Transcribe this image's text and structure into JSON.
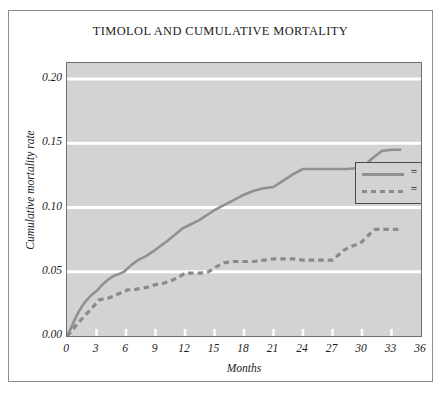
{
  "chart_data": {
    "type": "line",
    "title": "TIMOLOL AND CUMULATIVE MORTALITY",
    "xlabel": "Months",
    "ylabel": "Cumulative mortality rate",
    "xlim": [
      0,
      36
    ],
    "ylim": [
      0.0,
      0.2125
    ],
    "grid": "horizontal-white-gridlines",
    "plot_background": "#d3d3d3",
    "legend_position": "top-right-inside",
    "xticks": [
      "0",
      "3",
      "6",
      "9",
      "12",
      "15",
      "18",
      "21",
      "24",
      "27",
      "30",
      "33",
      "36"
    ],
    "xtick_values": [
      0,
      3,
      6,
      9,
      12,
      15,
      18,
      21,
      24,
      27,
      30,
      33,
      36
    ],
    "yticks": [
      "0.00",
      "0.05",
      "0.10",
      "0.15",
      "0.20"
    ],
    "ytick_values": [
      0.0,
      0.05,
      0.1,
      0.15,
      0.2
    ],
    "series": [
      {
        "name": "Placebo",
        "legend_label": "= Placebo",
        "style": "solid",
        "color": "#909090",
        "points": [
          [
            0.0,
            0.0
          ],
          [
            0.4,
            0.006
          ],
          [
            0.8,
            0.013
          ],
          [
            1.2,
            0.019
          ],
          [
            1.6,
            0.024
          ],
          [
            2.0,
            0.028
          ],
          [
            2.5,
            0.032
          ],
          [
            3.0,
            0.035
          ],
          [
            3.6,
            0.04
          ],
          [
            4.2,
            0.044
          ],
          [
            4.8,
            0.047
          ],
          [
            5.2,
            0.048
          ],
          [
            5.8,
            0.05
          ],
          [
            6.5,
            0.055
          ],
          [
            7.2,
            0.059
          ],
          [
            8.0,
            0.062
          ],
          [
            8.8,
            0.066
          ],
          [
            9.5,
            0.07
          ],
          [
            10.2,
            0.074
          ],
          [
            11.0,
            0.079
          ],
          [
            11.8,
            0.084
          ],
          [
            12.6,
            0.087
          ],
          [
            13.4,
            0.09
          ],
          [
            14.2,
            0.094
          ],
          [
            15.0,
            0.098
          ],
          [
            16.0,
            0.102
          ],
          [
            17.0,
            0.106
          ],
          [
            18.0,
            0.11
          ],
          [
            19.0,
            0.113
          ],
          [
            20.0,
            0.115
          ],
          [
            21.0,
            0.116
          ],
          [
            22.0,
            0.121
          ],
          [
            23.0,
            0.126
          ],
          [
            24.0,
            0.13
          ],
          [
            25.5,
            0.13
          ],
          [
            27.0,
            0.13
          ],
          [
            28.5,
            0.13
          ],
          [
            30.0,
            0.131
          ],
          [
            31.0,
            0.138
          ],
          [
            32.0,
            0.144
          ],
          [
            33.0,
            0.145
          ],
          [
            34.0,
            0.145
          ]
        ]
      },
      {
        "name": "Timolol",
        "legend_label": "= Timolol",
        "style": "dashed",
        "color": "#8a8a8a",
        "points": [
          [
            0.0,
            0.0
          ],
          [
            0.5,
            0.004
          ],
          [
            1.0,
            0.009
          ],
          [
            1.6,
            0.014
          ],
          [
            2.2,
            0.019
          ],
          [
            2.8,
            0.024
          ],
          [
            3.2,
            0.028
          ],
          [
            3.8,
            0.029
          ],
          [
            4.4,
            0.03
          ],
          [
            5.0,
            0.032
          ],
          [
            5.6,
            0.034
          ],
          [
            6.2,
            0.036
          ],
          [
            6.8,
            0.036
          ],
          [
            7.5,
            0.037
          ],
          [
            8.2,
            0.038
          ],
          [
            9.0,
            0.04
          ],
          [
            9.8,
            0.041
          ],
          [
            10.6,
            0.043
          ],
          [
            11.4,
            0.046
          ],
          [
            12.0,
            0.049
          ],
          [
            12.8,
            0.049
          ],
          [
            13.6,
            0.049
          ],
          [
            14.4,
            0.05
          ],
          [
            15.2,
            0.054
          ],
          [
            16.0,
            0.057
          ],
          [
            17.0,
            0.058
          ],
          [
            18.0,
            0.058
          ],
          [
            19.0,
            0.058
          ],
          [
            20.0,
            0.059
          ],
          [
            21.0,
            0.06
          ],
          [
            22.0,
            0.06
          ],
          [
            23.0,
            0.06
          ],
          [
            24.0,
            0.059
          ],
          [
            25.0,
            0.059
          ],
          [
            26.0,
            0.059
          ],
          [
            27.0,
            0.059
          ],
          [
            27.6,
            0.063
          ],
          [
            28.2,
            0.067
          ],
          [
            29.0,
            0.07
          ],
          [
            29.8,
            0.072
          ],
          [
            30.6,
            0.078
          ],
          [
            31.3,
            0.083
          ],
          [
            32.0,
            0.083
          ],
          [
            33.0,
            0.083
          ],
          [
            34.0,
            0.083
          ]
        ]
      }
    ]
  },
  "colors": {
    "plot_bg": "#d3d3d3",
    "gridline": "#ffffff",
    "placebo_line": "#909090",
    "timolol_line": "#8a8a8a",
    "axis": "#6e6e6e",
    "text": "#1b1b1b"
  }
}
